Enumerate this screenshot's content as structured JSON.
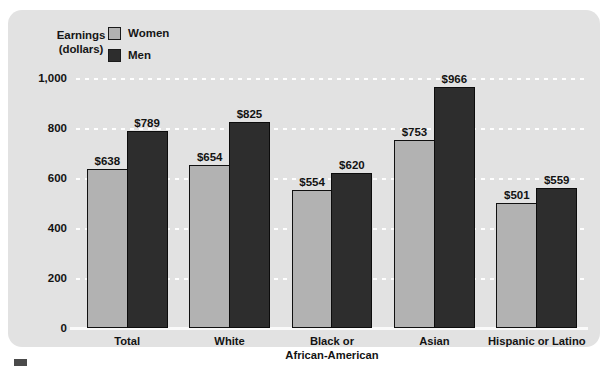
{
  "chart_data": {
    "type": "bar",
    "title": "",
    "ylabel": "Earnings (dollars)",
    "xlabel": "",
    "ylim": [
      0,
      1000
    ],
    "yticks": [
      0,
      200,
      400,
      600,
      800,
      1000
    ],
    "ytick_labels": [
      "0",
      "200",
      "400",
      "600",
      "800",
      "1,000"
    ],
    "grid": true,
    "legend_position": "top-left",
    "categories": [
      "Total",
      "White",
      "Black or African-American",
      "Asian",
      "Hispanic or Latino"
    ],
    "category_lines": [
      [
        "Total"
      ],
      [
        "White"
      ],
      [
        "Black or",
        "African-American"
      ],
      [
        "Asian"
      ],
      [
        "Hispanic or Latino"
      ]
    ],
    "series": [
      {
        "name": "Women",
        "color": "#b2b2b2",
        "values": [
          638,
          654,
          554,
          753,
          501
        ],
        "labels": [
          "$638",
          "$654",
          "$554",
          "$753",
          "$501"
        ]
      },
      {
        "name": "Men",
        "color": "#2d2d2d",
        "values": [
          789,
          825,
          620,
          966,
          559
        ],
        "labels": [
          "$789",
          "$825",
          "$620",
          "$966",
          "$559"
        ]
      }
    ]
  },
  "axis_title": {
    "line1": "Earnings",
    "line2": "(dollars)"
  },
  "legend": {
    "items": [
      {
        "label": "Women",
        "swatch": "light-gray"
      },
      {
        "label": "Men",
        "swatch": "dark-gray"
      }
    ]
  },
  "colors": {
    "panel_background": "#e2e2e2",
    "women_bar": "#b2b2b2",
    "men_bar": "#2d2d2d",
    "gridline": "#ffffff",
    "text": "#131313"
  }
}
